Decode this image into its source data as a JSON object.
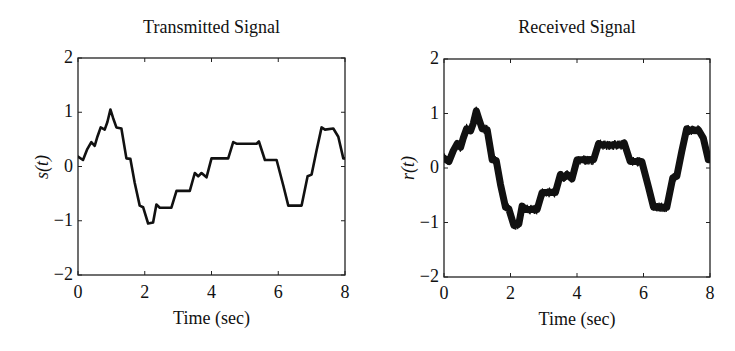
{
  "chart_data": [
    {
      "type": "line",
      "title": "Transmitted Signal",
      "xlabel": "Time (sec)",
      "ylabel": "s(t)",
      "xlim": [
        0,
        8
      ],
      "ylim": [
        -2,
        2
      ],
      "xticks": [
        0,
        2,
        4,
        6,
        8
      ],
      "yticks": [
        -2,
        -1,
        0,
        1,
        2
      ],
      "xtick_labels": [
        "0",
        "2",
        "4",
        "6",
        "8"
      ],
      "ytick_labels": [
        "−2",
        "−1",
        "0",
        "1",
        "2"
      ],
      "grid": false,
      "legend": null,
      "line_color": "#111111",
      "line_width": 2.6,
      "noise_amplitude": 0,
      "series": [
        {
          "name": "s(t)",
          "x": [
            0,
            0.15,
            0.28,
            0.4,
            0.5,
            0.58,
            0.68,
            0.8,
            0.88,
            0.97,
            1.05,
            1.15,
            1.3,
            1.45,
            1.57,
            1.7,
            1.85,
            1.95,
            2.1,
            2.25,
            2.35,
            2.45,
            2.8,
            2.95,
            3.35,
            3.5,
            3.6,
            3.7,
            3.85,
            4.0,
            4.5,
            4.65,
            4.75,
            5.35,
            5.42,
            5.6,
            5.95,
            6.15,
            6.3,
            6.7,
            6.88,
            7.0,
            7.15,
            7.3,
            7.4,
            7.65,
            7.8,
            7.95,
            8.0
          ],
          "y": [
            0.18,
            0.12,
            0.32,
            0.45,
            0.38,
            0.55,
            0.72,
            0.68,
            0.82,
            1.05,
            0.9,
            0.72,
            0.7,
            0.15,
            0.14,
            -0.3,
            -0.72,
            -0.75,
            -1.05,
            -1.03,
            -0.7,
            -0.76,
            -0.76,
            -0.45,
            -0.45,
            -0.12,
            -0.18,
            -0.12,
            -0.2,
            0.15,
            0.15,
            0.45,
            0.42,
            0.42,
            0.46,
            0.12,
            0.12,
            -0.35,
            -0.72,
            -0.72,
            -0.18,
            -0.15,
            0.3,
            0.72,
            0.68,
            0.7,
            0.55,
            0.15,
            0.15
          ]
        }
      ]
    },
    {
      "type": "line",
      "title": "Received Signal",
      "xlabel": "Time (sec)",
      "ylabel": "r(t)",
      "xlim": [
        0,
        8
      ],
      "ylim": [
        -2,
        2
      ],
      "xticks": [
        0,
        2,
        4,
        6,
        8
      ],
      "yticks": [
        -2,
        -1,
        0,
        1,
        2
      ],
      "xtick_labels": [
        "0",
        "2",
        "4",
        "6",
        "8"
      ],
      "ytick_labels": [
        "−2",
        "−1",
        "0",
        "1",
        "2"
      ],
      "grid": false,
      "legend": null,
      "line_color": "#111111",
      "line_width": 2.6,
      "noise_amplitude": 0.09,
      "series": [
        {
          "name": "r(t)",
          "x": [
            0,
            0.15,
            0.28,
            0.4,
            0.5,
            0.58,
            0.68,
            0.8,
            0.88,
            0.97,
            1.05,
            1.15,
            1.3,
            1.45,
            1.57,
            1.7,
            1.85,
            1.95,
            2.1,
            2.25,
            2.35,
            2.45,
            2.8,
            2.95,
            3.35,
            3.5,
            3.6,
            3.7,
            3.85,
            4.0,
            4.5,
            4.65,
            4.75,
            5.35,
            5.42,
            5.6,
            5.95,
            6.15,
            6.3,
            6.7,
            6.88,
            7.0,
            7.15,
            7.3,
            7.4,
            7.65,
            7.8,
            7.95,
            8.0
          ],
          "y": [
            0.18,
            0.12,
            0.32,
            0.45,
            0.38,
            0.55,
            0.72,
            0.68,
            0.82,
            1.05,
            0.9,
            0.72,
            0.7,
            0.15,
            0.14,
            -0.3,
            -0.72,
            -0.75,
            -1.05,
            -1.03,
            -0.7,
            -0.76,
            -0.76,
            -0.45,
            -0.45,
            -0.12,
            -0.18,
            -0.12,
            -0.2,
            0.15,
            0.15,
            0.45,
            0.42,
            0.42,
            0.46,
            0.12,
            0.12,
            -0.35,
            -0.72,
            -0.72,
            -0.18,
            -0.15,
            0.3,
            0.72,
            0.68,
            0.7,
            0.55,
            0.15,
            0.15
          ]
        }
      ]
    }
  ],
  "layout": {
    "panels": [
      {
        "box": {
          "left": 78,
          "top": 58,
          "right": 345,
          "bottom": 275
        },
        "ylabel_x": 42,
        "title_y": 17,
        "xtick_y": 282,
        "xlabel_y": 308
      },
      {
        "box": {
          "left": 444,
          "top": 59,
          "right": 710,
          "bottom": 277
        },
        "ylabel_x": 408,
        "title_y": 17,
        "xtick_y": 283,
        "xlabel_y": 309
      }
    ]
  }
}
